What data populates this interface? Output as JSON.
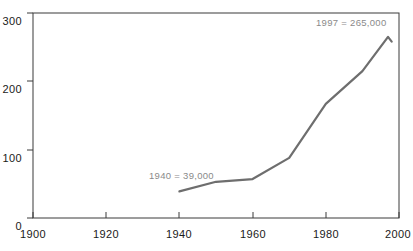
{
  "chart_data": {
    "type": "line",
    "title": "",
    "subtitle": "",
    "xlabel": "",
    "ylabel": "",
    "xlim": [
      1900,
      2000
    ],
    "ylim": [
      0,
      300
    ],
    "grid": false,
    "legend": "none",
    "x": [
      1940,
      1950,
      1960,
      1970,
      1980,
      1990,
      1997,
      1998
    ],
    "values": [
      39,
      53,
      57,
      88,
      167,
      215,
      265,
      258
    ],
    "series": [
      {
        "name": "series-1",
        "x": [
          1940,
          1950,
          1960,
          1970,
          1980,
          1990,
          1997,
          1998
        ],
        "values": [
          39,
          53,
          57,
          88,
          167,
          215,
          265,
          258
        ],
        "color": "#6e6e6e"
      }
    ],
    "xticks": [
      1900,
      1920,
      1940,
      1960,
      1980,
      2000
    ],
    "xtick_labels": [
      "1900",
      "1920",
      "1940",
      "1960",
      "1980",
      "2000"
    ],
    "yticks": [
      0,
      100,
      200,
      300
    ],
    "ytick_labels": [
      "0",
      "100",
      "200",
      "300"
    ],
    "annotations": [
      {
        "name": "annotation-1940",
        "text": "1940 = 39,000",
        "x": 1940,
        "y": 39
      },
      {
        "name": "annotation-1997",
        "text": "1997 = 265,000",
        "x": 1997,
        "y": 265
      }
    ],
    "colors": {
      "line": "#6e6e6e",
      "axis": "#3a3a3a",
      "tick_text": "#1a1a1a",
      "annotation_text": "#8a8a8a",
      "background": "#ffffff"
    }
  }
}
